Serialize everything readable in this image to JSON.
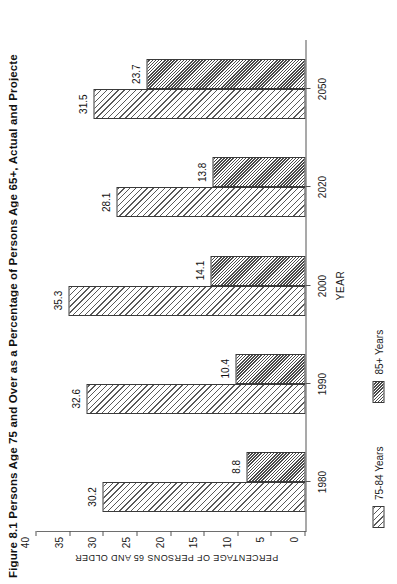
{
  "figure": {
    "title": "Figure 8.1  Persons Age 75 and Over as a Percentage of Persons Age 65+, Actual and Projecte"
  },
  "chart_data": {
    "type": "bar",
    "title": "Figure 8.1  Persons Age 75 and Over as a Percentage of Persons Age 65+, Actual and Projecte",
    "orientation": "vertical-grouped",
    "categories": [
      "1980",
      "1990",
      "2000",
      "2020",
      "2050"
    ],
    "series": [
      {
        "name": "75-84 Years",
        "values": [
          30.2,
          32.6,
          35.3,
          28.1,
          31.5
        ],
        "pattern": "diagonal-hatch-sparse"
      },
      {
        "name": "85+ Years",
        "values": [
          8.8,
          10.4,
          14.1,
          13.8,
          23.7
        ],
        "pattern": "diagonal-hatch-dense"
      }
    ],
    "xlabel": "YEAR",
    "ylabel": "PERCENTAGE OF PERSONS 65 AND OLDER",
    "ylim": [
      0,
      40
    ],
    "yticks": [
      0,
      5,
      10,
      15,
      20,
      25,
      30,
      35,
      40
    ],
    "xticklabels": [
      "1980",
      "1990",
      "2000",
      "2020",
      "2050"
    ],
    "grid": false,
    "legend_position": "below-axis-left",
    "legend": [
      "75-84 Years",
      "85+ Years"
    ],
    "data_labels": [
      {
        "category": "1980",
        "series": "75-84 Years",
        "label": "30.2"
      },
      {
        "category": "1980",
        "series": "85+ Years",
        "label": "8.8"
      },
      {
        "category": "1990",
        "series": "75-84 Years",
        "label": "32.6"
      },
      {
        "category": "1990",
        "series": "85+ Years",
        "label": "10.4"
      },
      {
        "category": "2000",
        "series": "75-84 Years",
        "label": "35.3"
      },
      {
        "category": "2000",
        "series": "85+ Years",
        "label": "14.1"
      },
      {
        "category": "2020",
        "series": "75-84 Years",
        "label": "28.1"
      },
      {
        "category": "2020",
        "series": "85+ Years",
        "label": "13.8"
      },
      {
        "category": "2050",
        "series": "75-84 Years",
        "label": "31.5"
      },
      {
        "category": "2050",
        "series": "85+ Years",
        "label": "23.7"
      }
    ]
  },
  "colors": {
    "background": "#ffffff",
    "axis": "#555555",
    "hatch": "#4a4a4a",
    "text": "#1a1a1a"
  }
}
